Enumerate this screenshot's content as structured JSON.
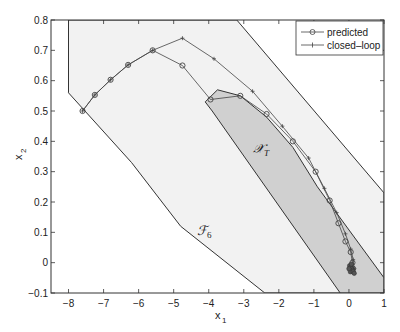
{
  "chart_data": {
    "type": "line",
    "title": "",
    "xlabel": "x1",
    "ylabel": "x2",
    "xlim": [
      -8.5,
      1
    ],
    "ylim": [
      -0.1,
      0.8
    ],
    "grid": false,
    "legend_position": "top-right",
    "x_ticks": [
      -8,
      -7,
      -6,
      -5,
      -4,
      -3,
      -2,
      -1,
      0,
      1
    ],
    "y_ticks": [
      -0.1,
      0,
      0.1,
      0.2,
      0.3,
      0.4,
      0.5,
      0.6,
      0.7,
      0.8
    ],
    "x_tick_labels": [
      "−8",
      "−7",
      "−6",
      "−5",
      "−4",
      "−3",
      "−2",
      "−1",
      "0",
      "1"
    ],
    "y_tick_labels": [
      "−0.1",
      "0",
      "0.1",
      "0.2",
      "0.3",
      "0.4",
      "0.5",
      "0.6",
      "0.7",
      "0.8"
    ],
    "regions": [
      {
        "name": "F6",
        "label": "ℱ₆",
        "fill": "#f2f2f2",
        "stroke": "#333333",
        "vertices": [
          [
            -8.0,
            0.8
          ],
          [
            -3.2,
            0.8
          ],
          [
            1.0,
            0.23
          ],
          [
            1.0,
            -0.1
          ],
          [
            -2.4,
            -0.1
          ],
          [
            -4.8,
            0.12
          ],
          [
            -6.2,
            0.33
          ],
          [
            -8.0,
            0.56
          ]
        ],
        "label_pos": [
          -4.1,
          0.12
        ]
      },
      {
        "name": "XT",
        "label": "𝒳_T",
        "fill": "#d0d0d0",
        "stroke": "#333333",
        "vertices": [
          [
            -3.75,
            0.57
          ],
          [
            -3.1,
            0.55
          ],
          [
            -2.35,
            0.48
          ],
          [
            -1.6,
            0.38
          ],
          [
            -0.9,
            0.25
          ],
          [
            1.0,
            -0.05
          ],
          [
            1.0,
            -0.1
          ],
          [
            -0.25,
            -0.1
          ],
          [
            -3.9,
            0.5
          ],
          [
            -4.1,
            0.53
          ]
        ],
        "label_pos": [
          -2.3,
          0.31
        ]
      }
    ],
    "series": [
      {
        "name": "predicted",
        "marker": "circle",
        "color": "#444444",
        "x": [
          -7.6,
          -7.25,
          -6.8,
          -6.3,
          -5.6,
          -4.75,
          -3.95,
          -3.1,
          -2.35,
          -1.6,
          -0.95,
          -0.55,
          -0.3,
          -0.1,
          0.05,
          0.1,
          0.12
        ],
        "y": [
          0.5,
          0.553,
          0.603,
          0.652,
          0.7,
          0.65,
          0.538,
          0.55,
          0.49,
          0.4,
          0.3,
          0.205,
          0.13,
          0.07,
          0.035,
          0.0,
          -0.02
        ]
      },
      {
        "name": "closed-loop",
        "marker": "plus",
        "color": "#444444",
        "x": [
          -7.6,
          -7.25,
          -6.8,
          -6.3,
          -5.6,
          -4.75,
          -3.85,
          -2.75,
          -1.9,
          -1.15,
          -0.7,
          -0.35,
          -0.1,
          0.05,
          0.12,
          0.15
        ],
        "y": [
          0.5,
          0.553,
          0.603,
          0.652,
          0.7,
          0.74,
          0.672,
          0.565,
          0.45,
          0.345,
          0.245,
          0.165,
          0.095,
          0.045,
          0.01,
          -0.02
        ]
      }
    ]
  },
  "legend": {
    "items": [
      {
        "label": "predicted",
        "marker": "circle"
      },
      {
        "label": "closed–loop",
        "marker": "plus"
      }
    ]
  },
  "axes": {
    "xlabel": "x",
    "xlabel_sub": "1",
    "ylabel": "x",
    "ylabel_sub": "2"
  },
  "regions": {
    "f6_label": "ℱ",
    "f6_sub": "6",
    "xt_label": "𝒳",
    "xt_sub": "T"
  }
}
